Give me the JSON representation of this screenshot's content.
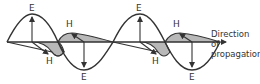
{
  "diagram": {
    "labels": {
      "e_field": "E",
      "h_field": "H"
    },
    "caption": {
      "line1": "Direction",
      "line2": "of",
      "line3": "propagation"
    },
    "colors": {
      "stroke": "#333333",
      "h_fill": "#b8b8b8",
      "background": "#ffffff"
    }
  }
}
